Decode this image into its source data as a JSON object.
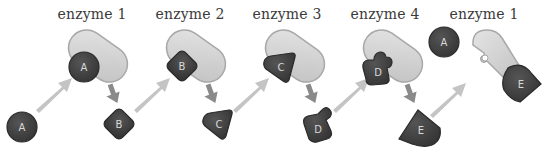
{
  "diagram": {
    "type": "metabolic-pathway",
    "colors": {
      "enzyme_fill": "#d2d2d2",
      "enzyme_stroke": "#a8a8a8",
      "molecule_fill": "#3f3f3f",
      "molecule_stroke": "#2a2a2a",
      "molecule_label": "#d8d8d8",
      "arrow_in": "#c4c4c4",
      "arrow_out": "#8a8a8a",
      "title_text": "#3a3a3a"
    },
    "steps": [
      {
        "enzyme_label": "enzyme 1",
        "substrate": "A",
        "bound": "A",
        "product": "B"
      },
      {
        "enzyme_label": "enzyme 2",
        "substrate": "B",
        "bound": "B",
        "product": "C"
      },
      {
        "enzyme_label": "enzyme 3",
        "substrate": "C",
        "bound": "C",
        "product": "D"
      },
      {
        "enzyme_label": "enzyme 4",
        "substrate": "D",
        "bound": "D",
        "product": "E"
      },
      {
        "enzyme_label": "enzyme 1",
        "free_molecule": "A",
        "bound": "E",
        "note": "feedback inhibition"
      }
    ]
  },
  "labels": {
    "t1": "enzyme 1",
    "t2": "enzyme 2",
    "t3": "enzyme 3",
    "t4": "enzyme 4",
    "t5": "enzyme 1",
    "A_in": "A",
    "A_bound": "A",
    "B_out": "B",
    "B_bound": "B",
    "C_out": "C",
    "C_bound": "C",
    "D_out": "D",
    "D_bound": "D",
    "E_out": "E",
    "A_free": "A",
    "E_bound": "E"
  }
}
